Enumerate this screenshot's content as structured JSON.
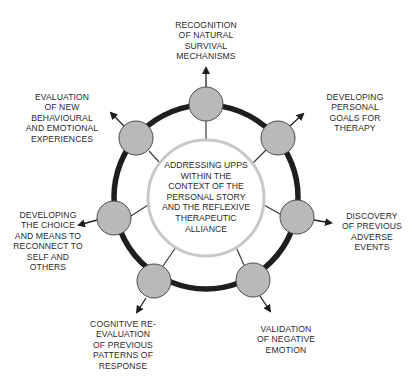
{
  "diagram": {
    "type": "circular-cycle",
    "center": {
      "text": "ADDRESSING UPPS\nWITHIN THE\nCONTEXT OF THE\nPERSONAL STORY\nAND THE REFLEXIVE\nTHERAPEUTIC\nALLIANCE"
    },
    "nodes": [
      {
        "id": "top",
        "label": "RECOGNITION\nOF NATURAL\nSURVIVAL\nMECHANISMS"
      },
      {
        "id": "upper-right",
        "label": "DEVELOPING\nPERSONAL\nGOALS FOR\nTHERAPY"
      },
      {
        "id": "right",
        "label": "DISCOVERY\nOF PREVIOUS\nADVERSE\nEVENTS"
      },
      {
        "id": "lower-right",
        "label": "VALIDATION\nOF NEGATIVE\nEMOTION"
      },
      {
        "id": "lower-left",
        "label": "COGNITIVE RE-\nEVALUATION\nOF PREVIOUS\nPATTERNS OF\nRESPONSE"
      },
      {
        "id": "left",
        "label": "DEVELOPING\nTHE CHOICE\nAND MEANS TO\nRECONNECT TO\nSELF AND\nOTHERS"
      },
      {
        "id": "upper-left",
        "label": "EVALUATION\nOF NEW\nBEHAVIOURAL\nAND EMOTIONAL\nEXPERIENCES"
      }
    ],
    "colors": {
      "ring": "#1e1e1e",
      "node_fill": "#b9b9b9",
      "node_stroke": "#4a4a4a",
      "center_stroke": "#c8c8c8",
      "spoke": "#3a3a3a",
      "text": "#2b2b2b"
    }
  }
}
